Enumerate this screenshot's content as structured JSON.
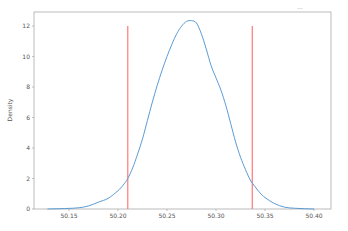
{
  "chart_data": {
    "type": "line",
    "title": "",
    "clipped_header_text": "...",
    "xlabel": "",
    "ylabel": "Density",
    "xlim": [
      50.12,
      50.41
    ],
    "ylim": [
      0,
      12.9
    ],
    "grid": false,
    "legend": null,
    "x_ticks": [
      50.15,
      50.2,
      50.25,
      50.3,
      50.35,
      50.4
    ],
    "x_tick_labels": [
      "50.15",
      "50.20",
      "50.25",
      "50.30",
      "50.35",
      "50.40"
    ],
    "y_ticks": [
      0,
      2,
      4,
      6,
      8,
      10,
      12
    ],
    "y_tick_labels": [
      "0",
      "2",
      "4",
      "6",
      "8",
      "10",
      "12"
    ],
    "series": [
      {
        "name": "density",
        "kind": "kde",
        "color": "#5b9bd5",
        "x": [
          50.128,
          50.14,
          50.15,
          50.16,
          50.17,
          50.18,
          50.19,
          50.2,
          50.205,
          50.21,
          50.215,
          50.22,
          50.225,
          50.23,
          50.235,
          50.24,
          50.245,
          50.25,
          50.255,
          50.26,
          50.265,
          50.27,
          50.275,
          50.28,
          50.285,
          50.29,
          50.295,
          50.3,
          50.305,
          50.31,
          50.315,
          50.32,
          50.325,
          50.33,
          50.335,
          50.34,
          50.345,
          50.35,
          50.36,
          50.37,
          50.38,
          50.39,
          50.4
        ],
        "y": [
          0.0,
          0.02,
          0.04,
          0.08,
          0.2,
          0.45,
          0.7,
          1.2,
          1.55,
          2.0,
          2.7,
          3.6,
          4.6,
          5.8,
          7.0,
          8.1,
          9.1,
          10.0,
          10.8,
          11.5,
          12.0,
          12.3,
          12.35,
          12.2,
          11.5,
          10.5,
          9.4,
          8.6,
          7.8,
          6.8,
          5.6,
          4.4,
          3.4,
          2.6,
          1.9,
          1.45,
          1.05,
          0.75,
          0.35,
          0.12,
          0.05,
          0.02,
          0.0
        ]
      }
    ],
    "vertical_lines": [
      {
        "name": "lower-bound",
        "x": 50.21,
        "y_top": 12.0,
        "color": "#ff6b6b"
      },
      {
        "name": "upper-bound",
        "x": 50.337,
        "y_top": 12.0,
        "color": "#ff6b6b"
      }
    ]
  },
  "colors": {
    "axis": "#999999",
    "tick_text": "#555555",
    "curve": "#5b9bd5",
    "vline": "#ff6b6b"
  }
}
